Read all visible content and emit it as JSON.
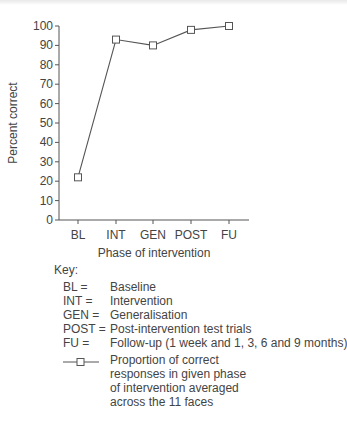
{
  "chart_data": {
    "type": "line",
    "title": "",
    "xlabel": "Phase of intervention",
    "ylabel": "Percent correct",
    "ylim": [
      0,
      100
    ],
    "yticks": [
      0,
      10,
      20,
      30,
      40,
      50,
      60,
      70,
      80,
      90,
      100
    ],
    "categories": [
      "BL",
      "INT",
      "GEN",
      "POST",
      "FU"
    ],
    "series": [
      {
        "name": "Proportion of correct responses in given phase of intervention averaged across the 11 faces",
        "marker": "open-square",
        "values": [
          22,
          93,
          90,
          98,
          100
        ]
      }
    ],
    "grid": false,
    "legend_position": "below"
  },
  "key": {
    "title": "Key:",
    "items": [
      {
        "abbr": "BL =",
        "meaning": "Baseline"
      },
      {
        "abbr": "INT =",
        "meaning": "Intervention"
      },
      {
        "abbr": "GEN =",
        "meaning": "Generalisation"
      },
      {
        "abbr": "POST =",
        "meaning": "Post-intervention test trials"
      },
      {
        "abbr": "FU =",
        "meaning": "Follow-up (1 week and 1, 3, 6 and 9 months)"
      }
    ]
  },
  "legend": {
    "lines": [
      "Proportion of correct",
      "responses in given phase",
      "of intervention averaged",
      "across the 11 faces"
    ]
  },
  "colors": {
    "line": "#555555",
    "text": "#444444"
  }
}
